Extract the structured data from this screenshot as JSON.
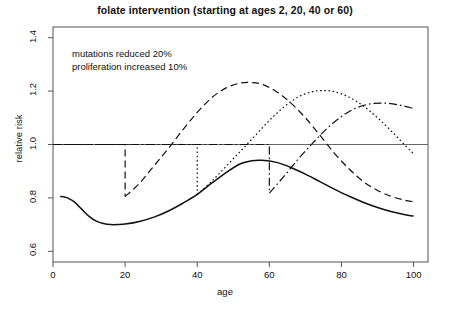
{
  "chart_data": {
    "type": "line",
    "title": "folate intervention (starting at ages 2, 20, 40 or 60)",
    "xlabel": "age",
    "ylabel": "relative risk",
    "xlim": [
      0,
      104
    ],
    "ylim": [
      0.56,
      1.44
    ],
    "xticks": [
      0,
      20,
      40,
      60,
      80,
      100
    ],
    "yticks": [
      0.6,
      0.8,
      1.0,
      1.2,
      1.4
    ],
    "xtick_labels": [
      "0",
      "20",
      "40",
      "60",
      "80",
      "100"
    ],
    "ytick_labels": [
      "0.6",
      "0.8",
      "1.0",
      "1.2",
      "1.4"
    ],
    "grid": false,
    "reference_line": {
      "y": 1.0,
      "style": "solid",
      "color": "#666666"
    },
    "annotations": [
      {
        "text": "mutations reduced 20%\nproliferation increased 10%",
        "x": 14,
        "y": 1.32
      }
    ],
    "legend": null,
    "series": [
      {
        "name": "start at age 2",
        "linestyle": "solid",
        "color": "#111111",
        "start_age": 2,
        "x": [
          2,
          3,
          4,
          6,
          8,
          10,
          12,
          14,
          16,
          18,
          20,
          24,
          28,
          32,
          36,
          40,
          44,
          48,
          52,
          55,
          58,
          62,
          66,
          70,
          74,
          78,
          82,
          86,
          90,
          94,
          98,
          100
        ],
        "y": [
          0.805,
          0.804,
          0.8,
          0.784,
          0.757,
          0.731,
          0.713,
          0.704,
          0.7,
          0.7,
          0.702,
          0.712,
          0.728,
          0.751,
          0.78,
          0.813,
          0.855,
          0.895,
          0.928,
          0.939,
          0.941,
          0.933,
          0.914,
          0.889,
          0.861,
          0.833,
          0.807,
          0.784,
          0.764,
          0.748,
          0.736,
          0.732
        ]
      },
      {
        "name": "start at age 20",
        "linestyle": "dashed",
        "color": "#111111",
        "start_age": 20,
        "drop_from": 1.0,
        "drop_to": 0.805,
        "x": [
          0,
          20,
          20,
          24,
          28,
          32,
          36,
          40,
          44,
          48,
          52,
          55,
          58,
          62,
          66,
          70,
          74,
          78,
          82,
          86,
          90,
          94,
          98,
          100
        ],
        "y": [
          1.0,
          1.0,
          0.805,
          0.855,
          0.92,
          0.985,
          1.055,
          1.12,
          1.175,
          1.212,
          1.23,
          1.232,
          1.225,
          1.198,
          1.155,
          1.1,
          1.035,
          0.968,
          0.91,
          0.862,
          0.828,
          0.805,
          0.79,
          0.786
        ]
      },
      {
        "name": "start at age 40",
        "linestyle": "dotted",
        "color": "#111111",
        "start_age": 40,
        "drop_from": 1.0,
        "drop_to": 0.812,
        "x": [
          0,
          40,
          40,
          44,
          48,
          52,
          56,
          60,
          64,
          68,
          72,
          75,
          78,
          82,
          86,
          90,
          94,
          98,
          100
        ],
        "y": [
          1.0,
          1.0,
          0.812,
          0.862,
          0.918,
          0.975,
          1.032,
          1.09,
          1.14,
          1.178,
          1.198,
          1.202,
          1.198,
          1.178,
          1.145,
          1.1,
          1.048,
          0.992,
          0.965
        ]
      },
      {
        "name": "start at age 60",
        "linestyle": "dashdot",
        "color": "#111111",
        "start_age": 60,
        "drop_from": 1.0,
        "drop_to": 0.818,
        "x": [
          0,
          60,
          60,
          64,
          68,
          72,
          76,
          80,
          84,
          88,
          92,
          96,
          100
        ],
        "y": [
          1.0,
          1.0,
          0.818,
          0.88,
          0.945,
          1.005,
          1.06,
          1.105,
          1.136,
          1.152,
          1.155,
          1.148,
          1.135
        ]
      }
    ]
  }
}
